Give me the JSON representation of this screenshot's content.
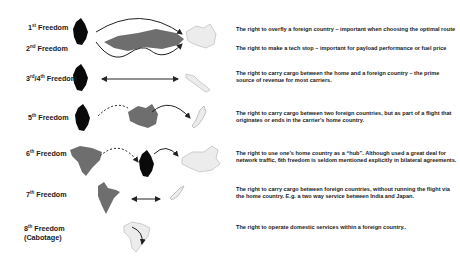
{
  "freedoms": [
    {
      "ordinal": "1",
      "suffix": "st",
      "name": "Freedom",
      "sub": "",
      "description": "The right to overfly a foreign country – important when choosing the optimal route"
    },
    {
      "ordinal": "2",
      "suffix": "nd",
      "name": "Freedom",
      "sub": "",
      "description": "The right to make a tech stop – important for payload performance or fuel price"
    },
    {
      "ordinal": "3",
      "suffix": "rd",
      "name": "/4",
      "suffix2": "th",
      "name2": " Freedom",
      "sub": "",
      "description": "The right to carry cargo between the home and a foreign country – the prime source of revenue for most carriers."
    },
    {
      "ordinal": "5",
      "suffix": "th",
      "name": "Freedom",
      "sub": "",
      "description": "The right to carry cargo between two foreign countries, but as part of a flight that originates or ends in the carrier's home country."
    },
    {
      "ordinal": "6",
      "suffix": "th",
      "name": "Freedom",
      "sub": "",
      "description": "The right to use one's home country as a “hub”. Although used a great deal for network traffic, 6th freedom is seldom mentioned explicitly in bilateral agreements."
    },
    {
      "ordinal": "7",
      "suffix": "th",
      "name": "Freedom",
      "sub": "",
      "description": "The right to carry cargo between foreign countries, without running the flight via the home country. E.g. a two way service between India and Japan."
    },
    {
      "ordinal": "8",
      "suffix": "th",
      "name": "Freedom",
      "sub": "(Cabotage)",
      "description": "The right to operate domestic services within a foreign country.."
    }
  ],
  "legend_colors": {
    "home": "#0a0a0a",
    "foreign": "#6e6e6e",
    "destination": "#e6e6e6"
  }
}
